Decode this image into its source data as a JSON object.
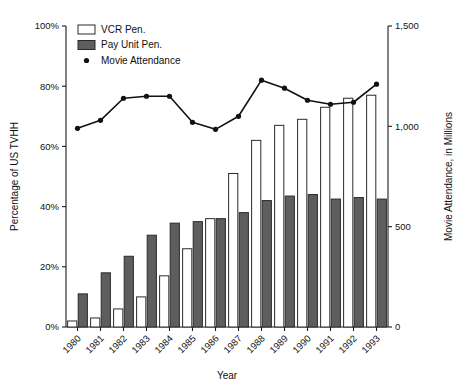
{
  "chart_data": {
    "type": "bar",
    "title": "",
    "xlabel": "Year",
    "ylabel": "Percentage of US TVHH",
    "y2label": "Movie Attendance, in Millions",
    "categories": [
      "1980",
      "1981",
      "1982",
      "1983",
      "1984",
      "1985",
      "1986",
      "1987",
      "1988",
      "1989",
      "1990",
      "1991",
      "1992",
      "1993"
    ],
    "series": [
      {
        "name": "VCR Pen.",
        "type": "bar",
        "axis": "left",
        "units": "percent",
        "color": "#ffffff",
        "values": [
          2,
          3,
          6,
          10,
          17,
          26,
          36,
          51,
          62,
          67,
          69,
          73,
          76,
          77
        ]
      },
      {
        "name": "Pay Unit Pen.",
        "type": "bar",
        "axis": "left",
        "units": "percent",
        "color": "#5e5e5e",
        "values": [
          11,
          18,
          23.5,
          30.5,
          34.5,
          35,
          36,
          38,
          42,
          43.5,
          44,
          42.5,
          43,
          42.5
        ]
      },
      {
        "name": "Movie Attendance",
        "type": "line",
        "axis": "right",
        "units": "millions",
        "color": "#111111",
        "values": [
          990,
          1030,
          1140,
          1150,
          1150,
          1020,
          985,
          1050,
          1230,
          1190,
          1130,
          1110,
          1120,
          1210
        ]
      }
    ],
    "ylim": [
      0,
      100
    ],
    "yticks": [
      0,
      20,
      40,
      60,
      80,
      100
    ],
    "yticklabels": [
      "0%",
      "20%",
      "40%",
      "60%",
      "80%",
      "100%"
    ],
    "y2lim": [
      0,
      1500
    ],
    "y2ticks": [
      0,
      500,
      1000,
      1500
    ],
    "y2ticklabels": [
      "0",
      "500",
      "1,000",
      "1,500"
    ],
    "grid": false,
    "legend_position": "top-left",
    "legend": [
      {
        "label": "VCR Pen.",
        "marker": "square-open"
      },
      {
        "label": "Pay Unit Pen.",
        "marker": "square-filled"
      },
      {
        "label": "Movie Attendance",
        "marker": "dot"
      }
    ]
  }
}
